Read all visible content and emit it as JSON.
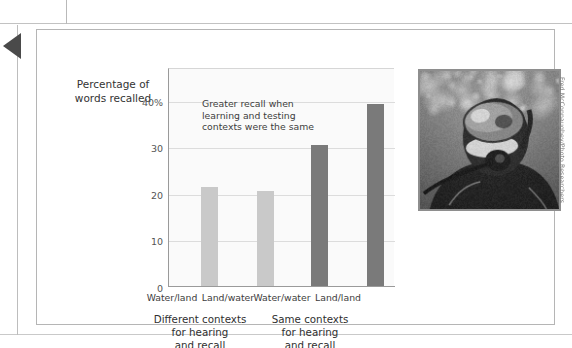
{
  "figure": {
    "axis_title": "Percentage of\nwords recalled",
    "annotation": "Greater recall when\nlearning and testing\ncontexts were the same",
    "photo_credit": "Fred McConnaughey/Photo Researchers",
    "photo_alt": "scuba-diver-underwater"
  },
  "chart_data": {
    "type": "bar",
    "title": "",
    "xlabel": "",
    "ylabel": "Percentage of words recalled",
    "categories": [
      "Water/land",
      "Land/water",
      "Water/water",
      "Land/land"
    ],
    "values": [
      21.5,
      20.5,
      30.5,
      39.3
    ],
    "bar_colors": [
      "#c9c9c9",
      "#c9c9c9",
      "#7a7a7a",
      "#7a7a7a"
    ],
    "ylim": [
      0,
      47
    ],
    "yticks": [
      0,
      10,
      20,
      30,
      40
    ],
    "ytick_labels": [
      "0",
      "10",
      "20",
      "30",
      "40%"
    ],
    "grid": true,
    "legend": "none",
    "annotations": [
      "Greater recall when learning and testing contexts were the same"
    ],
    "groups": [
      {
        "label": "Different contexts\nfor hearing\nand recall",
        "categories": [
          "Water/land",
          "Land/water"
        ]
      },
      {
        "label": "Same contexts\nfor hearing\nand recall",
        "categories": [
          "Water/water",
          "Land/land"
        ]
      }
    ]
  },
  "colors": {
    "bar_light": "#c9c9c9",
    "bar_dark": "#7a7a7a",
    "grid": "#dcdcdc",
    "axis": "#9a9a9a",
    "plot_bg": "#fafafa",
    "text": "#3b3b3b"
  }
}
